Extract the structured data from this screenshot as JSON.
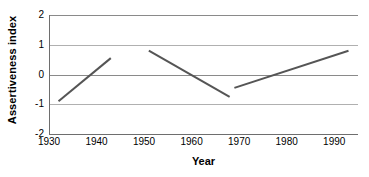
{
  "chart_data": {
    "type": "line",
    "title": "",
    "xlabel": "Year",
    "ylabel": "Assertiveness index",
    "xlim": [
      1930,
      1995
    ],
    "ylim": [
      -2,
      2
    ],
    "xticks": [
      1930,
      1940,
      1950,
      1960,
      1970,
      1980,
      1990
    ],
    "xtick_labels": [
      "1930",
      "1940",
      "1950",
      "1960",
      "1970",
      "1980",
      "1990"
    ],
    "yticks": [
      2,
      1,
      0,
      -1,
      -2
    ],
    "ytick_labels": [
      "2",
      "1",
      "0",
      "-1",
      "-2"
    ],
    "grid": true,
    "gridlines_y": [
      2,
      1,
      0,
      -1,
      -2
    ],
    "legend": null,
    "legend_position": "none",
    "series": [
      {
        "name": "segment-1",
        "x": [
          1932,
          1943
        ],
        "y": [
          -0.9,
          0.55
        ]
      },
      {
        "name": "segment-2",
        "x": [
          1951,
          1968
        ],
        "y": [
          0.8,
          -0.75
        ]
      },
      {
        "name": "segment-3",
        "x": [
          1969,
          1993
        ],
        "y": [
          -0.45,
          0.8
        ]
      }
    ],
    "line_color": "#555555",
    "line_width": 2,
    "grid_color": "#b0b0b0",
    "axis_color": "#6e6e6e",
    "background": "#ffffff"
  }
}
